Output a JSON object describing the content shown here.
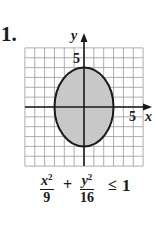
{
  "problem": {
    "number": "1."
  },
  "chart_data": {
    "type": "region",
    "title": "",
    "xlabel": "x",
    "ylabel": "y",
    "xlim": [
      -6,
      6
    ],
    "ylim": [
      -6,
      6
    ],
    "grid": true,
    "grid_step": 1,
    "tick_labels": {
      "x": [
        "5"
      ],
      "y": [
        "5"
      ]
    },
    "shapes": [
      {
        "kind": "ellipse",
        "center": [
          0,
          0
        ],
        "semi_x": 3,
        "semi_y": 4,
        "boundary": "solid",
        "shaded_inside": true,
        "fill": "#c8c8c8",
        "stroke": "#1a1a1a"
      }
    ],
    "inequality": {
      "term1": {
        "numerator": "x",
        "exponent": "2",
        "denominator": "9"
      },
      "plus": "+",
      "term2": {
        "numerator": "y",
        "exponent": "2",
        "denominator": "16"
      },
      "relation": "≤",
      "rhs": "1"
    }
  }
}
